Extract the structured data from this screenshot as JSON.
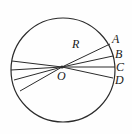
{
  "figure": {
    "type": "geometry-diagram",
    "background_color": "#fefefe",
    "stroke_color": "#2b2b2b",
    "label_color": "#1a1a1a",
    "circle": {
      "center_x": 63,
      "center_y": 70,
      "radius": 52
    },
    "center_point": {
      "name": "center-point",
      "label": "O",
      "x": 62,
      "y": 67,
      "label_x": 57,
      "label_y": 70
    },
    "radius_label": {
      "name": "radius-label",
      "label": "R",
      "label_x": 72,
      "label_y": 38
    },
    "right_points": [
      {
        "label": "A",
        "end_x": 110,
        "end_y": 44,
        "label_x": 112,
        "label_y": 33
      },
      {
        "label": "B",
        "end_x": 113,
        "end_y": 56,
        "label_x": 115,
        "label_y": 48
      },
      {
        "label": "C",
        "end_x": 115,
        "end_y": 67,
        "label_x": 116,
        "label_y": 61
      },
      {
        "label": "D",
        "end_x": 113,
        "end_y": 78,
        "label_x": 115,
        "label_y": 74
      }
    ],
    "left_rays": [
      {
        "end_x": 12,
        "end_y": 61
      },
      {
        "end_x": 11,
        "end_y": 70
      },
      {
        "end_x": 14,
        "end_y": 80
      },
      {
        "end_x": 20,
        "end_y": 91
      }
    ]
  }
}
